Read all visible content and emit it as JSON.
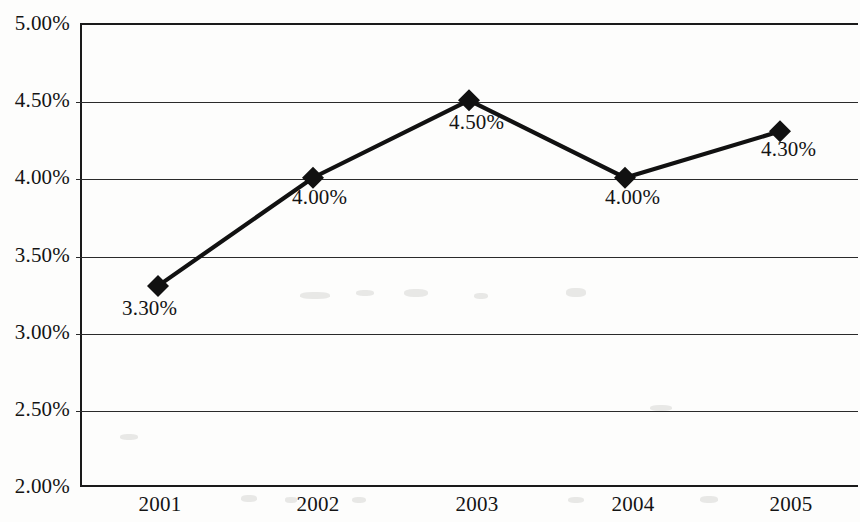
{
  "chart_data": {
    "type": "line",
    "title": "",
    "subtitle": "",
    "xlabel": "",
    "ylabel": "",
    "categories": [
      "2001",
      "2002",
      "2003",
      "2004",
      "2005"
    ],
    "values": [
      3.3,
      4.0,
      4.5,
      4.0,
      4.3
    ],
    "point_labels": [
      "3.30%",
      "4.00%",
      "4.50%",
      "4.00%",
      "4.30%"
    ],
    "series": [
      {
        "name": "",
        "values": [
          3.3,
          4.0,
          4.5,
          4.0,
          4.3
        ]
      }
    ],
    "ylim": [
      2.0,
      5.0
    ],
    "ytick_values": [
      5.0,
      4.5,
      4.0,
      3.5,
      3.0,
      2.5,
      2.0
    ],
    "ytick_labels": [
      "5.00%",
      "4.50%",
      "4.00%",
      "3.50%",
      "3.00%",
      "2.50%",
      "2.00%"
    ],
    "xtick_labels": [
      "2001",
      "2002",
      "2003",
      "2004",
      "2005"
    ],
    "grid": true,
    "grid_axis": "y",
    "legend": false,
    "legend_position": "none",
    "marker": "diamond",
    "line_color": "#111111",
    "marker_color": "#111111",
    "grid_color": "#2a2a2a",
    "axis_color": "#1a1a1a",
    "background_color": "#fdfdfc",
    "text_color": "#141414",
    "annotations": []
  }
}
